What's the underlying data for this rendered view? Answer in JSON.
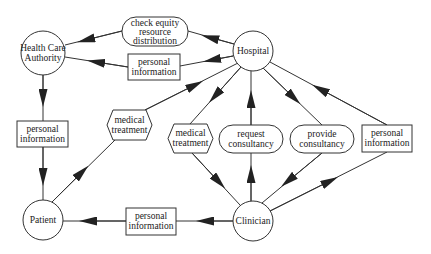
{
  "diagram": {
    "type": "data-flow",
    "colors": {
      "stroke": "#333333",
      "background": "#ffffff",
      "text": "#222222"
    },
    "entities": {
      "health_care_authority": {
        "line1": "Health Care",
        "line2": "Authority"
      },
      "hospital": {
        "label": "Hospital"
      },
      "patient": {
        "label": "Patient"
      },
      "clinician": {
        "label": "Clinician"
      }
    },
    "flows": {
      "check_equity": {
        "line1": "check  equity",
        "line2": "resource",
        "line3": "distribution",
        "from": "Hospital",
        "to": "Health Care Authority",
        "shape": "rounded"
      },
      "pi_hospital_to_hca": {
        "line1": "personal",
        "line2": "information",
        "from": "Hospital",
        "to": "Health Care Authority",
        "shape": "rectangle"
      },
      "pi_hca_to_patient": {
        "line1": "personal",
        "line2": "information",
        "from": "Health Care Authority",
        "to": "Patient",
        "shape": "rectangle"
      },
      "med_treatment_patient": {
        "line1": "medical",
        "line2": "treatment",
        "from": "Patient",
        "to": "Hospital",
        "shape": "hexagon"
      },
      "med_treatment_clinician": {
        "line1": "medical",
        "line2": "treatment",
        "from": "Hospital",
        "to": "Clinician",
        "shape": "hexagon"
      },
      "request_consultancy": {
        "line1": "request",
        "line2": "consultancy",
        "from": "Clinician",
        "to": "Hospital",
        "shape": "rounded"
      },
      "provide_consultancy": {
        "line1": "provide",
        "line2": "consultancy",
        "from": "Hospital",
        "to": "Clinician",
        "shape": "rounded"
      },
      "pi_clinician_to_hospital": {
        "line1": "personal",
        "line2": "information",
        "from": "Clinician",
        "to": "Hospital",
        "shape": "rectangle"
      },
      "pi_clinician_to_patient": {
        "line1": "personal",
        "line2": "information",
        "from": "Clinician",
        "to": "Patient",
        "shape": "rectangle"
      }
    }
  }
}
